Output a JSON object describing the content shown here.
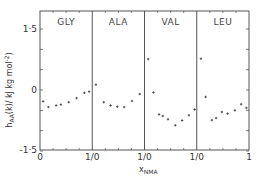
{
  "chart_data": {
    "type": "scatter",
    "title": "",
    "xlabel": "x_NMA",
    "xlabel_main": "x",
    "xlabel_sub": "NMA",
    "ylabel": "h_AA(k) / kJ kg mol^-2",
    "ylabel_main": "h",
    "ylabel_sub": "AA",
    "ylabel_rest": "(k)/ kJ kg mol",
    "ylabel_sup": "-2",
    "ylim": [
      -1.5,
      1.5
    ],
    "y_ticks": [
      1.5,
      0,
      -1.5
    ],
    "y_tick_labels": [
      "1·5",
      "0",
      "-1·5"
    ],
    "x_tick_labels": [
      "0",
      "1/0",
      "1/0",
      "1/0",
      "1"
    ],
    "grid": false,
    "panels": [
      {
        "name": "GLY",
        "xlim": [
          0,
          1
        ],
        "x": [
          0.06,
          0.16,
          0.31,
          0.4,
          0.55,
          0.7,
          0.85,
          0.94
        ],
        "y": [
          -0.28,
          -0.42,
          -0.38,
          -0.36,
          -0.3,
          -0.2,
          -0.07,
          -0.04
        ]
      },
      {
        "name": "ALA",
        "xlim": [
          0,
          1
        ],
        "x": [
          0.07,
          0.22,
          0.35,
          0.48,
          0.61,
          0.76,
          0.91
        ],
        "y": [
          0.13,
          -0.3,
          -0.38,
          -0.41,
          -0.42,
          -0.27,
          -0.1
        ]
      },
      {
        "name": "VAL",
        "xlim": [
          0,
          1
        ],
        "x": [
          0.07,
          0.17,
          0.28,
          0.35,
          0.45,
          0.59,
          0.72,
          0.85,
          0.96
        ],
        "y": [
          0.76,
          -0.06,
          -0.6,
          -0.64,
          -0.72,
          -0.87,
          -0.75,
          -0.62,
          -0.48
        ]
      },
      {
        "name": "LEU",
        "xlim": [
          0,
          1
        ],
        "x": [
          0.08,
          0.17,
          0.29,
          0.37,
          0.48,
          0.59,
          0.73,
          0.85,
          0.95
        ],
        "y": [
          0.77,
          -0.17,
          -0.74,
          -0.69,
          -0.54,
          -0.58,
          -0.5,
          -0.35,
          -0.44
        ]
      }
    ]
  }
}
